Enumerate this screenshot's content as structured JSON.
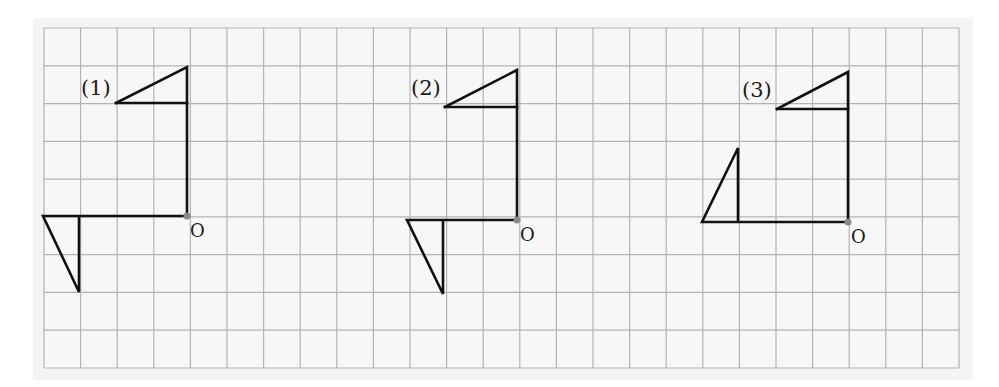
{
  "diagram": {
    "colors": {
      "page_bg": "#ffffff",
      "panel_bg": "#f4f4f4",
      "cell_bg": "#f7f7f7",
      "grid_line": "#b3b3b3",
      "stroke": "#111111",
      "origin_dot": "#8a8a8a"
    },
    "grid": {
      "left": 44,
      "top": 28,
      "right": 959,
      "bottom": 368,
      "columns": 25,
      "rows": 9
    },
    "figures": [
      {
        "label": "(1)",
        "label_pos": [
          81,
          78
        ],
        "origin": [
          187,
          216
        ],
        "origin_label": "O",
        "origin_label_pos": [
          190,
          222
        ],
        "polylines": [
          [
            [
              116,
              103
            ],
            [
              187,
              67
            ],
            [
              187,
              216
            ]
          ],
          [
            [
              116,
              103
            ],
            [
              187,
              103
            ]
          ],
          [
            [
              187,
              216
            ],
            [
              43,
              216
            ],
            [
              79,
              292
            ],
            [
              79,
              216
            ]
          ]
        ]
      },
      {
        "label": "(2)",
        "label_pos": [
          411,
          78
        ],
        "origin": [
          517,
          220
        ],
        "origin_label": "O",
        "origin_label_pos": [
          520,
          226
        ],
        "polylines": [
          [
            [
              445,
              107
            ],
            [
              517,
              70
            ],
            [
              517,
              220
            ]
          ],
          [
            [
              445,
              107
            ],
            [
              517,
              107
            ]
          ],
          [
            [
              517,
              220
            ],
            [
              407,
              220
            ],
            [
              443,
              294
            ],
            [
              443,
              220
            ]
          ]
        ]
      },
      {
        "label": "(3)",
        "label_pos": [
          742,
          80
        ],
        "origin": [
          848,
          222
        ],
        "origin_label": "O",
        "origin_label_pos": [
          851,
          228
        ],
        "polylines": [
          [
            [
              777,
              109
            ],
            [
              848,
              72
            ],
            [
              848,
              222
            ]
          ],
          [
            [
              777,
              109
            ],
            [
              848,
              109
            ]
          ],
          [
            [
              848,
              222
            ],
            [
              702,
              222
            ],
            [
              738,
              148
            ],
            [
              738,
              222
            ]
          ]
        ]
      }
    ]
  }
}
